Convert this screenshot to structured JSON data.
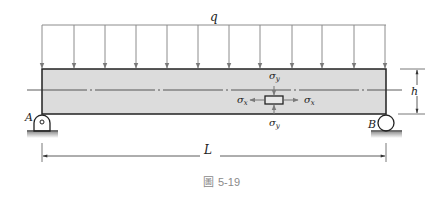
{
  "figure": {
    "caption_prefix": "圖",
    "caption_number": "5-19",
    "labels": {
      "load": "q",
      "height": "h",
      "length": "L",
      "support_left": "A",
      "support_right": "B",
      "sigma_x_left": "σx",
      "sigma_x_right": "σx",
      "sigma_y_top": "σy",
      "sigma_y_bottom": "σy"
    },
    "load_arrow_count": 12,
    "colors": {
      "beam_fill": "#dcdcdc",
      "beam_stroke": "#222222",
      "arrow": "#8c8c8c",
      "ground": "#a8a8a8",
      "caption": "#8a8a8a"
    }
  }
}
